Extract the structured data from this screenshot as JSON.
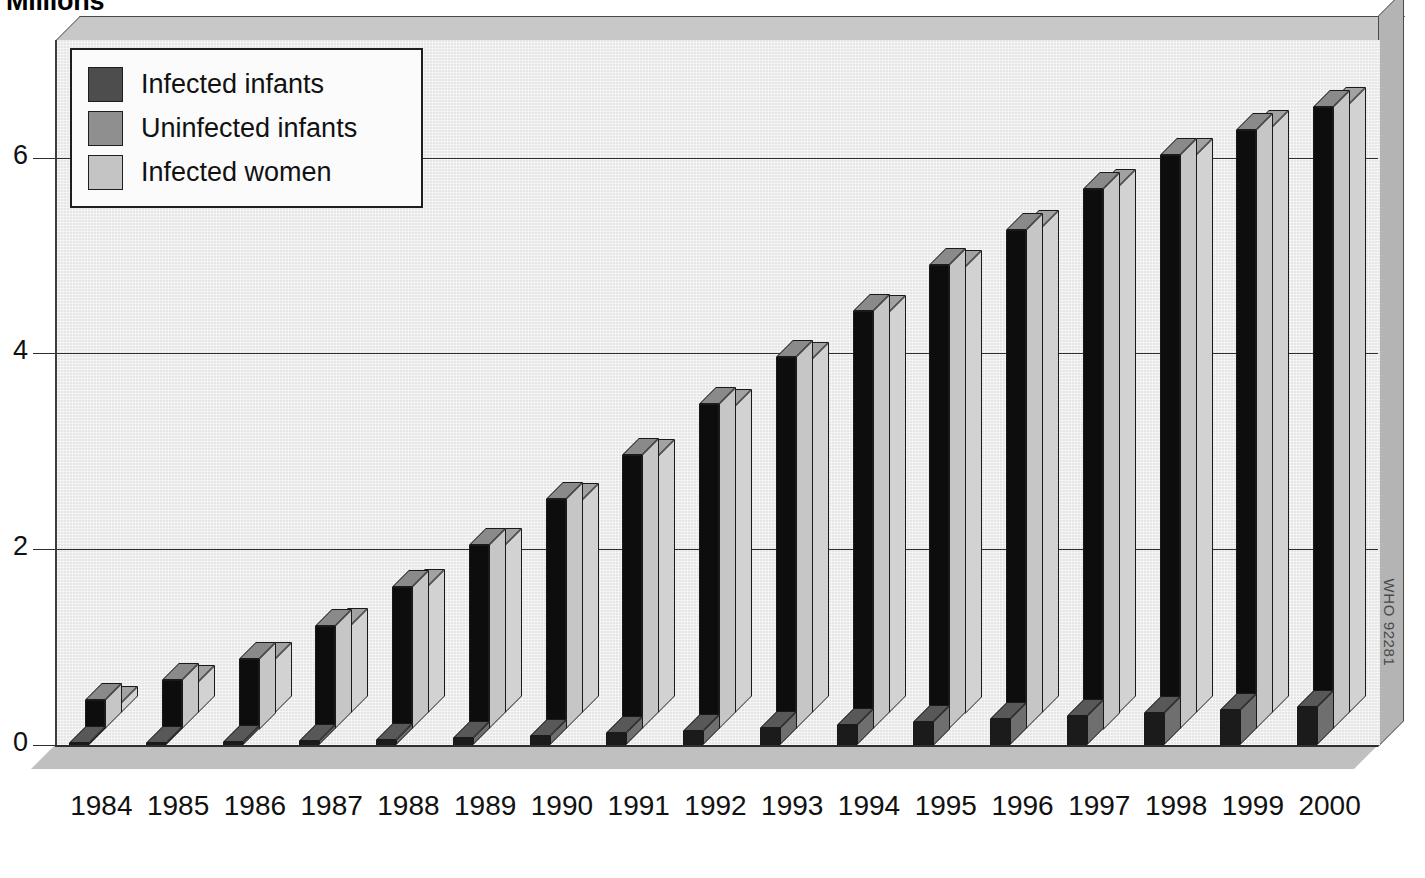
{
  "title": "Millions",
  "credit": "WHO 92281",
  "legend": {
    "items": [
      {
        "key": "infected_infants",
        "label": "Infected infants",
        "color": "#4d4d4d"
      },
      {
        "key": "uninfected_infants",
        "label": "Uninfected infants",
        "color": "#8f8f8f"
      },
      {
        "key": "infected_women",
        "label": "Infected women",
        "color": "#c4c4c4"
      }
    ]
  },
  "axis": {
    "y_ticks": [
      "0",
      "2",
      "4",
      "6"
    ],
    "y_tick_values": [
      0,
      2,
      4,
      6
    ],
    "y_min": 0,
    "y_max": 7.2
  },
  "chart_data": {
    "type": "bar",
    "title": "Millions",
    "xlabel": "",
    "ylabel": "Millions",
    "ylim": [
      0,
      7.2
    ],
    "grid": true,
    "legend_position": "top-left",
    "style": "3d-grouped-column",
    "categories": [
      "1984",
      "1985",
      "1986",
      "1987",
      "1988",
      "1989",
      "1990",
      "1991",
      "1992",
      "1993",
      "1994",
      "1995",
      "1996",
      "1997",
      "1998",
      "1999",
      "2000"
    ],
    "series": [
      {
        "name": "Infected infants",
        "color": "#4d4d4d",
        "values": [
          0.01,
          0.02,
          0.03,
          0.04,
          0.05,
          0.07,
          0.09,
          0.12,
          0.14,
          0.17,
          0.2,
          0.24,
          0.27,
          0.3,
          0.33,
          0.36,
          0.39
        ]
      },
      {
        "name": "Uninfected infants",
        "color": "#8f8f8f",
        "values": [
          0.3,
          0.5,
          0.72,
          1.05,
          1.45,
          1.88,
          2.35,
          2.8,
          3.32,
          3.8,
          4.27,
          4.74,
          5.1,
          5.52,
          5.86,
          6.12,
          6.35
        ]
      },
      {
        "name": "Infected women",
        "color": "#c4c4c4",
        "values": [
          0.1,
          0.32,
          0.55,
          0.9,
          1.3,
          1.72,
          2.18,
          2.62,
          3.14,
          3.62,
          4.1,
          4.56,
          4.96,
          5.38,
          5.7,
          5.98,
          6.22
        ]
      }
    ]
  }
}
